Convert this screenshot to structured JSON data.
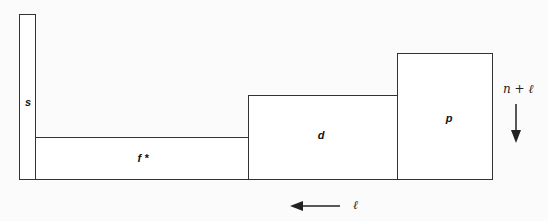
{
  "diagram": {
    "blocks": [
      {
        "id": "s",
        "label": "s"
      },
      {
        "id": "f",
        "label": "f *"
      },
      {
        "id": "d",
        "label": "d"
      },
      {
        "id": "p",
        "label": "p"
      }
    ],
    "vertical_axis": {
      "label": "n + ℓ",
      "direction": "down"
    },
    "horizontal_axis": {
      "label": "ℓ",
      "direction": "left"
    },
    "colors": {
      "stroke": "#333333",
      "background": "#fbfbfb"
    }
  }
}
